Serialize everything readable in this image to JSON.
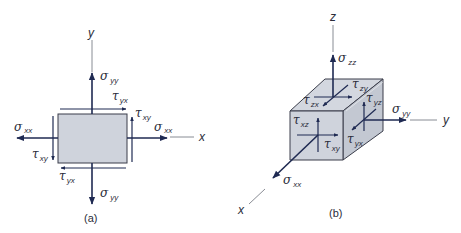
{
  "colors": {
    "arrow": "#1f2a52",
    "axis": "#6b6e78",
    "fill": "#cfd3dc",
    "fill_dark": "#bcc1cc",
    "edge": "#3a3d4a",
    "text": "#2b2d3a"
  },
  "panel_a": {
    "caption": "(a)",
    "axes": {
      "x": "x",
      "y": "y"
    },
    "labels": [
      {
        "id": "sigma_yy_top",
        "symbol": "σ",
        "sub": "yy"
      },
      {
        "id": "tau_yx_top",
        "symbol": "τ",
        "sub": "yx"
      },
      {
        "id": "tau_xy_right",
        "symbol": "τ",
        "sub": "xy"
      },
      {
        "id": "sigma_xx_left",
        "symbol": "σ",
        "sub": "xx"
      },
      {
        "id": "sigma_xx_right",
        "symbol": "σ",
        "sub": "xx"
      },
      {
        "id": "tau_xy_left",
        "symbol": "τ",
        "sub": "xy"
      },
      {
        "id": "tau_yx_bottom",
        "symbol": "τ",
        "sub": "yx"
      },
      {
        "id": "sigma_yy_bottom",
        "symbol": "σ",
        "sub": "yy"
      }
    ]
  },
  "panel_b": {
    "caption": "(b)",
    "axes": {
      "x": "x",
      "y": "y",
      "z": "z"
    },
    "labels": [
      {
        "id": "sigma_zz",
        "symbol": "σ",
        "sub": "zz"
      },
      {
        "id": "tau_zy",
        "symbol": "τ",
        "sub": "zy"
      },
      {
        "id": "tau_zx",
        "symbol": "τ",
        "sub": "zx"
      },
      {
        "id": "tau_yz",
        "symbol": "τ",
        "sub": "yz"
      },
      {
        "id": "sigma_yy",
        "symbol": "σ",
        "sub": "yy"
      },
      {
        "id": "tau_xz",
        "symbol": "τ",
        "sub": "xz"
      },
      {
        "id": "tau_xy",
        "symbol": "τ",
        "sub": "xy"
      },
      {
        "id": "tau_yx",
        "symbol": "τ",
        "sub": "yx"
      },
      {
        "id": "sigma_xx",
        "symbol": "σ",
        "sub": "xx"
      }
    ]
  }
}
